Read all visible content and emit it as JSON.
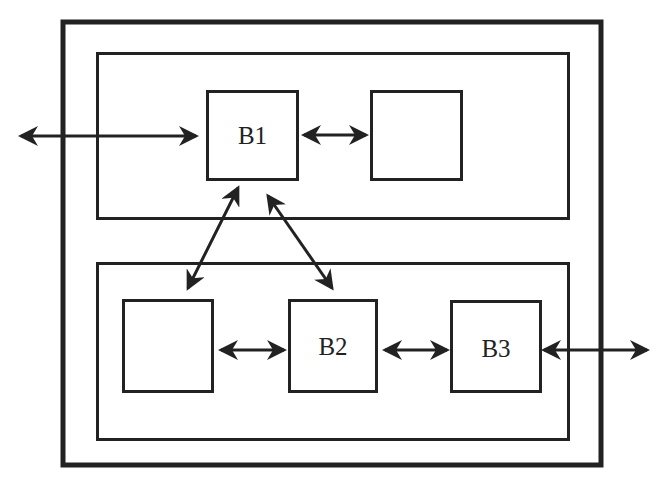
{
  "diagram": {
    "type": "block-diagram",
    "stroke_color": "#222222",
    "background": "#ffffff",
    "outer_frame": {
      "x": 61,
      "y": 20,
      "w": 542,
      "h": 447
    },
    "panels": [
      {
        "id": "top-panel",
        "x": 96,
        "y": 52,
        "w": 474,
        "h": 168
      },
      {
        "id": "bottom-panel",
        "x": 96,
        "y": 262,
        "w": 474,
        "h": 179
      }
    ],
    "blocks": [
      {
        "id": "b1",
        "label": "B1",
        "x": 206,
        "y": 90,
        "w": 93,
        "h": 91
      },
      {
        "id": "top-right",
        "label": "",
        "x": 370,
        "y": 90,
        "w": 93,
        "h": 91
      },
      {
        "id": "bottom-left",
        "label": "",
        "x": 122,
        "y": 299,
        "w": 92,
        "h": 94
      },
      {
        "id": "b2",
        "label": "B2",
        "x": 288,
        "y": 299,
        "w": 90,
        "h": 94
      },
      {
        "id": "b3",
        "label": "B3",
        "x": 450,
        "y": 300,
        "w": 92,
        "h": 93
      }
    ],
    "connections": [
      {
        "id": "external-left-to-b1",
        "from": "external-left",
        "to": "b1",
        "bidirectional": true
      },
      {
        "id": "b1-to-top-right",
        "from": "b1",
        "to": "top-right",
        "bidirectional": true
      },
      {
        "id": "b1-to-bottom-left",
        "from": "b1",
        "to": "bottom-left",
        "bidirectional": true
      },
      {
        "id": "b1-to-b2",
        "from": "b1",
        "to": "b2",
        "bidirectional": true
      },
      {
        "id": "bottom-left-to-b2",
        "from": "bottom-left",
        "to": "b2",
        "bidirectional": true
      },
      {
        "id": "b2-to-b3",
        "from": "b2",
        "to": "b3",
        "bidirectional": true
      },
      {
        "id": "b3-to-external-right",
        "from": "b3",
        "to": "external-right",
        "bidirectional": true
      }
    ]
  }
}
